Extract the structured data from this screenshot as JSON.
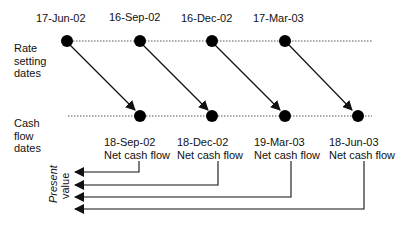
{
  "diagram": {
    "row_labels": {
      "rate_setting": [
        "Rate",
        "setting",
        "dates"
      ],
      "cash_flow": [
        "Cash",
        "flow",
        "dates"
      ]
    },
    "rate_setting_dates": [
      "17-Jun-02",
      "16-Sep-02",
      "16-Dec-02",
      "17-Mar-03"
    ],
    "cash_flow_dates": [
      "18-Sep-02",
      "18-Dec-02",
      "19-Mar-03",
      "18-Jun-03"
    ],
    "cash_flow_caption": "Net cash flow",
    "present_value_label": [
      "Present",
      "value"
    ]
  }
}
